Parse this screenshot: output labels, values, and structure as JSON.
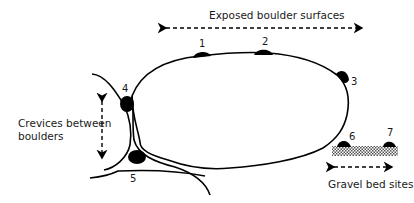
{
  "diagram": {
    "labels": {
      "exposed": "Exposed boulder surfaces",
      "crevices_line1": "Crevices between",
      "crevices_line2": "boulders",
      "gravel": "Gravel bed sites"
    },
    "sites": [
      {
        "id": "1",
        "label": "1"
      },
      {
        "id": "2",
        "label": "2"
      },
      {
        "id": "3",
        "label": "3"
      },
      {
        "id": "4",
        "label": "4"
      },
      {
        "id": "5",
        "label": "5"
      },
      {
        "id": "6",
        "label": "6"
      },
      {
        "id": "7",
        "label": "7"
      }
    ],
    "colors": {
      "stroke": "#000000",
      "text": "#1a1a1a",
      "gravel": "#9a9a9a"
    }
  }
}
